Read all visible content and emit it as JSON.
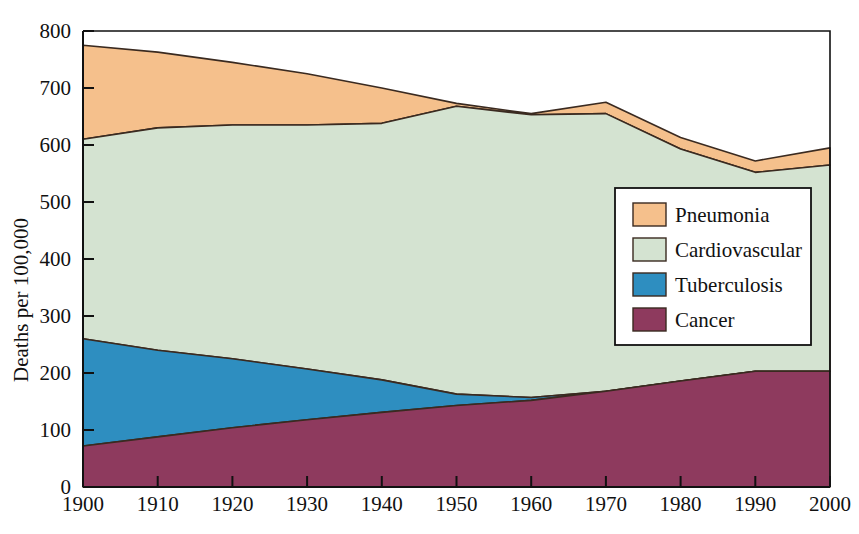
{
  "chart_data": {
    "type": "area",
    "stacked": true,
    "title": "",
    "xlabel": "",
    "ylabel": "Deaths per 100,000",
    "xlim": [
      1900,
      2000
    ],
    "ylim": [
      0,
      800
    ],
    "grid": false,
    "legend_position": "right-middle",
    "x": [
      1900,
      1910,
      1920,
      1930,
      1940,
      1950,
      1960,
      1970,
      1980,
      1990,
      2000
    ],
    "xticks": [
      "1900",
      "1910",
      "1920",
      "1930",
      "1940",
      "1950",
      "1960",
      "1970",
      "1980",
      "1990",
      "2000"
    ],
    "yticks": [
      "0",
      "100",
      "200",
      "300",
      "400",
      "500",
      "600",
      "700",
      "800"
    ],
    "ytick_values": [
      0,
      100,
      200,
      300,
      400,
      500,
      600,
      700,
      800
    ],
    "series": [
      {
        "name": "Cancer",
        "color": "#8E3A5E",
        "values": [
          72,
          88,
          104,
          118,
          131,
          143,
          152,
          168,
          186,
          203,
          203
        ],
        "cumulative_top": [
          72,
          88,
          104,
          118,
          131,
          143,
          152,
          168,
          186,
          203,
          203
        ]
      },
      {
        "name": "Tuberculosis",
        "color": "#2E8EC0",
        "values": [
          188,
          152,
          121,
          89,
          57,
          20,
          5,
          0,
          0,
          0,
          0
        ],
        "cumulative_top": [
          260,
          240,
          225,
          207,
          188,
          163,
          157,
          168,
          186,
          203,
          203
        ]
      },
      {
        "name": "Cardiovascular",
        "color": "#D4E3D1",
        "values": [
          350,
          390,
          410,
          428,
          450,
          505,
          496,
          487,
          407,
          349,
          362
        ],
        "cumulative_top": [
          610,
          630,
          635,
          635,
          638,
          668,
          653,
          655,
          593,
          552,
          565
        ]
      },
      {
        "name": "Pneumonia",
        "color": "#F5C08C",
        "values": [
          165,
          133,
          110,
          90,
          62,
          5,
          2,
          20,
          20,
          20,
          30
        ],
        "cumulative_top": [
          775,
          763,
          745,
          725,
          700,
          673,
          655,
          675,
          613,
          572,
          595
        ]
      }
    ],
    "totals": [
      775,
      763,
      745,
      725,
      700,
      673,
      655,
      675,
      613,
      572,
      595
    ]
  },
  "legend": {
    "items": [
      {
        "label": "Pneumonia",
        "color": "#F5C08C"
      },
      {
        "label": "Cardiovascular",
        "color": "#D4E3D1"
      },
      {
        "label": "Tuberculosis",
        "color": "#2E8EC0"
      },
      {
        "label": "Cancer",
        "color": "#8E3A5E"
      }
    ]
  },
  "axes": {
    "y_title": "Deaths per 100,000"
  },
  "style": {
    "axis_color": "#111111",
    "outline_color": "#3a2a20",
    "background": "#ffffff"
  }
}
